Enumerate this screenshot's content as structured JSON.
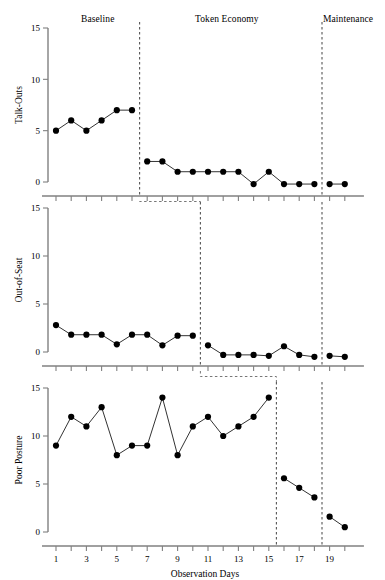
{
  "figure": {
    "xlabel": "Observation Days",
    "phase_headers": [
      {
        "label": "Baseline",
        "x": 98
      },
      {
        "label": "Token Economy",
        "x": 227
      },
      {
        "label": "Maintenance",
        "x": 348
      }
    ]
  },
  "chart_data": {
    "type": "line",
    "title": "",
    "xlabel": "Observation Days",
    "xlim": [
      0.4,
      20.6
    ],
    "xticks": [
      1,
      3,
      5,
      7,
      9,
      11,
      13,
      15,
      17,
      19
    ],
    "xticklabels": [
      "1",
      "3",
      "5",
      "7",
      "9",
      "11",
      "13",
      "15",
      "17",
      "19"
    ],
    "x_minor_ticks": [
      1,
      2,
      3,
      4,
      5,
      6,
      7,
      8,
      9,
      10,
      11,
      12,
      13,
      14,
      15,
      16,
      17,
      18,
      19,
      20
    ],
    "ylim": [
      0,
      15
    ],
    "yticks": [
      0,
      5,
      10,
      15
    ],
    "yticklabels": [
      "0",
      "5",
      "10",
      "15"
    ],
    "grid": false,
    "legend": "none",
    "design": "multiple-baseline",
    "phases": [
      "Baseline",
      "Token Economy",
      "Maintenance"
    ],
    "panels": [
      {
        "ylabel": "Talk-Outs",
        "phase_change_days": [
          6.5,
          18.5
        ],
        "x": [
          1,
          2,
          3,
          4,
          5,
          6,
          7,
          8,
          9,
          10,
          11,
          12,
          13,
          14,
          15,
          16,
          17,
          18,
          19,
          20
        ],
        "y": [
          5,
          6,
          5,
          6,
          7,
          7,
          2,
          2,
          1,
          1,
          1,
          1,
          1,
          -0.2,
          1,
          -0.2,
          -0.2,
          -0.2,
          -0.2,
          -0.2
        ],
        "segments": [
          {
            "phase": "Baseline",
            "x": [
              1,
              2,
              3,
              4,
              5,
              6
            ],
            "y": [
              5,
              6,
              5,
              6,
              7,
              7
            ]
          },
          {
            "phase": "Token Economy",
            "x": [
              7,
              8,
              9,
              10,
              11,
              12,
              13,
              14,
              15,
              16,
              17,
              18
            ],
            "y": [
              2,
              2,
              1,
              1,
              1,
              1,
              1,
              -0.2,
              1,
              -0.2,
              -0.2,
              -0.2
            ]
          },
          {
            "phase": "Maintenance",
            "x": [
              19,
              20
            ],
            "y": [
              -0.2,
              -0.2
            ]
          }
        ]
      },
      {
        "ylabel": "Out-of-Seat",
        "phase_change_days": [
          10.5,
          18.5
        ],
        "x": [
          1,
          2,
          3,
          4,
          5,
          6,
          7,
          8,
          9,
          10,
          11,
          12,
          13,
          14,
          15,
          16,
          17,
          18,
          19,
          20
        ],
        "y": [
          2.8,
          1.8,
          1.8,
          1.8,
          0.8,
          1.8,
          1.8,
          0.7,
          1.7,
          1.7,
          0.7,
          -0.3,
          -0.3,
          -0.3,
          -0.4,
          0.6,
          -0.3,
          -0.5,
          -0.4,
          -0.5
        ],
        "segments": [
          {
            "phase": "Baseline",
            "x": [
              1,
              2,
              3,
              4,
              5,
              6,
              7,
              8,
              9,
              10
            ],
            "y": [
              2.8,
              1.8,
              1.8,
              1.8,
              0.8,
              1.8,
              1.8,
              0.7,
              1.7,
              1.7
            ]
          },
          {
            "phase": "Token Economy",
            "x": [
              11,
              12,
              13,
              14,
              15,
              16,
              17,
              18
            ],
            "y": [
              0.7,
              -0.3,
              -0.3,
              -0.3,
              -0.4,
              0.6,
              -0.3,
              -0.5
            ]
          },
          {
            "phase": "Maintenance",
            "x": [
              19,
              20
            ],
            "y": [
              -0.4,
              -0.5
            ]
          }
        ]
      },
      {
        "ylabel": "Poor Posture",
        "phase_change_days": [
          15.5,
          18.5
        ],
        "x": [
          1,
          2,
          3,
          4,
          5,
          6,
          7,
          8,
          9,
          10,
          11,
          12,
          13,
          14,
          15,
          16,
          17,
          18,
          19,
          20
        ],
        "y": [
          9,
          12,
          11,
          13,
          8,
          9,
          9,
          14,
          8,
          11,
          12,
          10,
          11,
          12,
          14,
          5.6,
          4.6,
          3.6,
          1.6,
          0.5
        ],
        "segments": [
          {
            "phase": "Baseline",
            "x": [
              1,
              2,
              3,
              4,
              5,
              6,
              7,
              8,
              9,
              10,
              11,
              12,
              13,
              14,
              15
            ],
            "y": [
              9,
              12,
              11,
              13,
              8,
              9,
              9,
              14,
              8,
              11,
              12,
              10,
              11,
              12,
              14
            ]
          },
          {
            "phase": "Token Economy",
            "x": [
              16,
              17,
              18
            ],
            "y": [
              5.6,
              4.6,
              3.6
            ]
          },
          {
            "phase": "Maintenance",
            "x": [
              19,
              20
            ],
            "y": [
              1.6,
              0.5
            ]
          }
        ]
      }
    ],
    "connectors": [
      {
        "from_panel": 0,
        "to_panel": 1,
        "from_day": 6.5,
        "to_day": 10.5
      },
      {
        "from_panel": 1,
        "to_panel": 2,
        "from_day": 10.5,
        "to_day": 15.5
      }
    ]
  }
}
